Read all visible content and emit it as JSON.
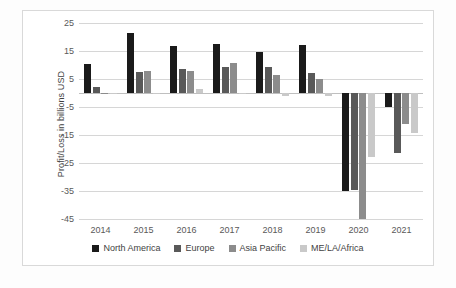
{
  "chart_data": {
    "type": "bar",
    "title": "",
    "subtitle": "",
    "xlabel": "",
    "ylabel": "Profit/Loss in billions USD",
    "categories": [
      "2014",
      "2015",
      "2016",
      "2017",
      "2018",
      "2019",
      "2020",
      "2021"
    ],
    "ylim": [
      -45,
      25
    ],
    "yticks": [
      25,
      15,
      5,
      -5,
      -15,
      -25,
      -35,
      -45
    ],
    "grid": true,
    "legend_position": "bottom",
    "series": [
      {
        "name": "North America",
        "color": "#1a1a1a",
        "values": [
          10.4,
          21.6,
          16.8,
          17.6,
          14.5,
          17.2,
          -35.0,
          -5.0
        ]
      },
      {
        "name": "Europe",
        "color": "#595959",
        "values": [
          2.0,
          7.6,
          8.6,
          9.2,
          9.4,
          7.0,
          -34.6,
          -21.5
        ]
      },
      {
        "name": "Asia Pacific",
        "color": "#8c8c8c",
        "values": [
          0.1,
          7.9,
          7.7,
          10.7,
          6.5,
          4.9,
          -45.0,
          -11.0
        ]
      },
      {
        "name": "ME/LA/Africa",
        "color": "#c9c9c9",
        "values": [
          0.0,
          0.1,
          1.4,
          0.0,
          -1.2,
          -1.2,
          -22.7,
          -14.2
        ]
      }
    ]
  }
}
